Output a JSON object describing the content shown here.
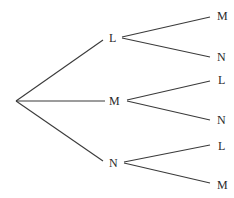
{
  "diagram": {
    "type": "tree",
    "root": {
      "x": 16,
      "y": 101
    },
    "level1": [
      {
        "label": "L",
        "x": 113,
        "y": 38
      },
      {
        "label": "M",
        "x": 115,
        "y": 101
      },
      {
        "label": "N",
        "x": 113,
        "y": 163
      }
    ],
    "level2": [
      {
        "parent": 0,
        "label": "M",
        "x": 222,
        "y": 16
      },
      {
        "parent": 0,
        "label": "N",
        "x": 222,
        "y": 57
      },
      {
        "parent": 1,
        "label": "L",
        "x": 222,
        "y": 80
      },
      {
        "parent": 1,
        "label": "N",
        "x": 222,
        "y": 120
      },
      {
        "parent": 2,
        "label": "L",
        "x": 222,
        "y": 146
      },
      {
        "parent": 2,
        "label": "M",
        "x": 222,
        "y": 185
      }
    ]
  }
}
